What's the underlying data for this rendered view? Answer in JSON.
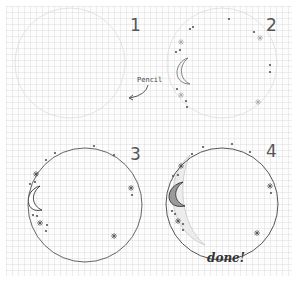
{
  "steps": [
    {
      "number": "1",
      "note": "Pencil"
    },
    {
      "number": "2"
    },
    {
      "number": "3"
    },
    {
      "number": "4",
      "caption": "done!"
    }
  ],
  "colors": {
    "ink": "#3a3a3a",
    "pencil": "#d4d4d4",
    "grid": "#e6e6e6",
    "paper": "#fdfdfd"
  }
}
